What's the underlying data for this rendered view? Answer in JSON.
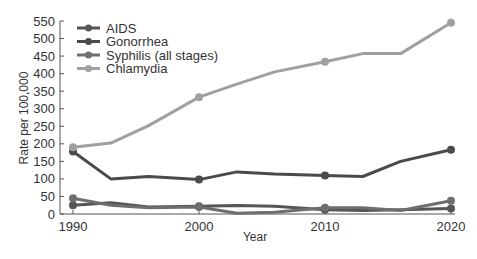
{
  "chart_data": {
    "type": "line",
    "title": "",
    "xlabel": "Year",
    "ylabel": "Rate per 100,000",
    "xlim": [
      1990,
      2020
    ],
    "ylim": [
      0,
      550
    ],
    "x_ticks": [
      1990,
      2000,
      2010,
      2020
    ],
    "y_ticks": [
      0,
      50,
      100,
      150,
      200,
      250,
      300,
      350,
      400,
      450,
      500,
      550
    ],
    "grid": false,
    "legend_position": "upper-left",
    "series": [
      {
        "name": "AIDS",
        "color": "#555555",
        "points": [
          [
            1990,
            25
          ],
          [
            1993,
            32
          ],
          [
            1996,
            20
          ],
          [
            2000,
            22
          ],
          [
            2003,
            24
          ],
          [
            2006,
            22
          ],
          [
            2010,
            12
          ],
          [
            2013,
            10
          ],
          [
            2016,
            12
          ],
          [
            2020,
            16
          ]
        ],
        "markers": [
          1990,
          2000,
          2010,
          2020
        ]
      },
      {
        "name": "Gonorrhea",
        "color": "#4a4a4a",
        "points": [
          [
            1990,
            178
          ],
          [
            1993,
            100
          ],
          [
            1996,
            107
          ],
          [
            2000,
            98
          ],
          [
            2003,
            120
          ],
          [
            2006,
            114
          ],
          [
            2010,
            110
          ],
          [
            2013,
            107
          ],
          [
            2016,
            150
          ],
          [
            2020,
            183
          ]
        ],
        "markers": [
          1990,
          2000,
          2010,
          2020
        ]
      },
      {
        "name": "Syphilis (all stages)",
        "color": "#6e6e6e",
        "points": [
          [
            1990,
            45
          ],
          [
            1993,
            25
          ],
          [
            1996,
            18
          ],
          [
            2000,
            20
          ],
          [
            2003,
            2
          ],
          [
            2006,
            5
          ],
          [
            2010,
            18
          ],
          [
            2013,
            18
          ],
          [
            2016,
            10
          ],
          [
            2020,
            38
          ]
        ],
        "markers": [
          1990,
          2000,
          2010,
          2020
        ]
      },
      {
        "name": "Chlamydia",
        "color": "#a0a0a0",
        "points": [
          [
            1990,
            190
          ],
          [
            1993,
            202
          ],
          [
            1996,
            252
          ],
          [
            2000,
            333
          ],
          [
            2003,
            370
          ],
          [
            2006,
            405
          ],
          [
            2010,
            434
          ],
          [
            2013,
            457
          ],
          [
            2016,
            457
          ],
          [
            2020,
            545
          ]
        ],
        "markers": [
          1990,
          2000,
          2010,
          2020
        ]
      }
    ]
  }
}
